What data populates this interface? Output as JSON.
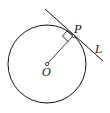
{
  "diagram": {
    "labels": {
      "center": "O",
      "point": "P",
      "line": "L"
    },
    "colors": {
      "stroke": "#111111",
      "background": "#ffffff"
    },
    "circle": {
      "cx": 47,
      "cy": 64,
      "r": 39
    },
    "tangent_line": {
      "x1": 45,
      "y1": 9,
      "x2": 103,
      "y2": 61
    },
    "radius_segment": {
      "from": "O",
      "to": "P"
    },
    "right_angle_marker": true
  }
}
